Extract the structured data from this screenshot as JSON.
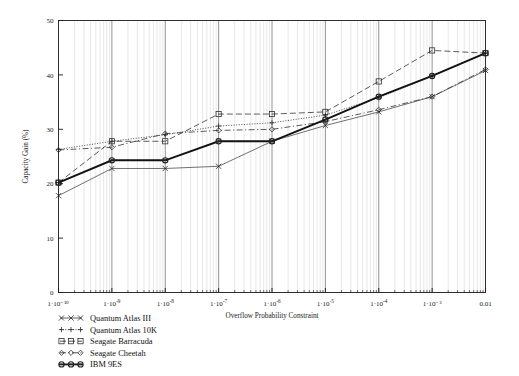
{
  "chart_data": {
    "type": "line",
    "title": "",
    "xlabel": "Overflow Probability Constraint",
    "ylabel": "Capacity Gain (%)",
    "xscale": "log",
    "xlim": [
      1e-10,
      0.01
    ],
    "ylim": [
      0,
      50
    ],
    "yticks": [
      0,
      10,
      20,
      30,
      40,
      50
    ],
    "xticks": [
      1e-10,
      1e-09,
      1e-08,
      1e-07,
      1e-06,
      1e-05,
      0.0001,
      0.001,
      0.01
    ],
    "xtick_labels": [
      "1·10⁻¹⁰",
      "1·10⁻⁹",
      "1·10⁻⁸",
      "1·10⁻⁷",
      "1·10⁻⁶",
      "1·10⁻⁵",
      "1·10⁻⁴",
      "1·10⁻³",
      "0.01"
    ],
    "grid": true,
    "grid_minor": true,
    "legend_position": "below-left",
    "x": [
      1e-10,
      1e-09,
      1e-08,
      1e-07,
      1e-06,
      1e-05,
      0.0001,
      0.001,
      0.01
    ],
    "series": [
      {
        "name": "Quantum Atlas III",
        "marker": "x",
        "dash": "solid",
        "width": 0.7,
        "color": "#333333",
        "values": [
          17.8,
          22.8,
          22.8,
          23.2,
          27.8,
          30.7,
          33.2,
          36.0,
          40.8
        ]
      },
      {
        "name": "Quantum Atlas 10K",
        "marker": "plus",
        "dash": "dotted",
        "width": 0.8,
        "color": "#333333",
        "values": [
          26.3,
          27.8,
          29.0,
          30.6,
          31.2,
          32.6,
          35.8,
          39.8,
          44.0
        ]
      },
      {
        "name": "Seagate Barracuda",
        "marker": "square",
        "dash": "dashed",
        "width": 0.8,
        "color": "#333333",
        "values": [
          20.2,
          27.8,
          27.8,
          32.8,
          32.8,
          33.2,
          38.8,
          44.5,
          44.0
        ]
      },
      {
        "name": "Seagate Cheetah",
        "marker": "diamond",
        "dash": "dashdot",
        "width": 0.8,
        "color": "#333333",
        "values": [
          26.2,
          26.7,
          29.2,
          29.8,
          30.0,
          31.4,
          33.6,
          36.0,
          41.0
        ]
      },
      {
        "name": "IBM 9ES",
        "marker": "circle",
        "dash": "solid",
        "width": 1.9,
        "color": "#111111",
        "values": [
          20.2,
          24.3,
          24.3,
          27.8,
          27.8,
          31.8,
          36.0,
          39.8,
          44.0
        ]
      }
    ]
  },
  "legend": {
    "items": [
      {
        "label": "Quantum Atlas III",
        "marker": "x",
        "dash": "solid",
        "width": 0.7
      },
      {
        "label": "Quantum Atlas 10K",
        "marker": "plus",
        "dash": "dotted",
        "width": 0.8
      },
      {
        "label": "Seagate Barracuda",
        "marker": "square",
        "dash": "dashed",
        "width": 0.8
      },
      {
        "label": "Seagate Cheetah",
        "marker": "diamond",
        "dash": "dashdot",
        "width": 0.8
      },
      {
        "label": "IBM 9ES",
        "marker": "circle",
        "dash": "solid",
        "width": 1.9
      }
    ]
  },
  "colors": {
    "axis": "#1a1a1a",
    "grid_major": "#6f6f6f",
    "grid_minor": "#d8d8d8",
    "background": "#ffffff"
  }
}
